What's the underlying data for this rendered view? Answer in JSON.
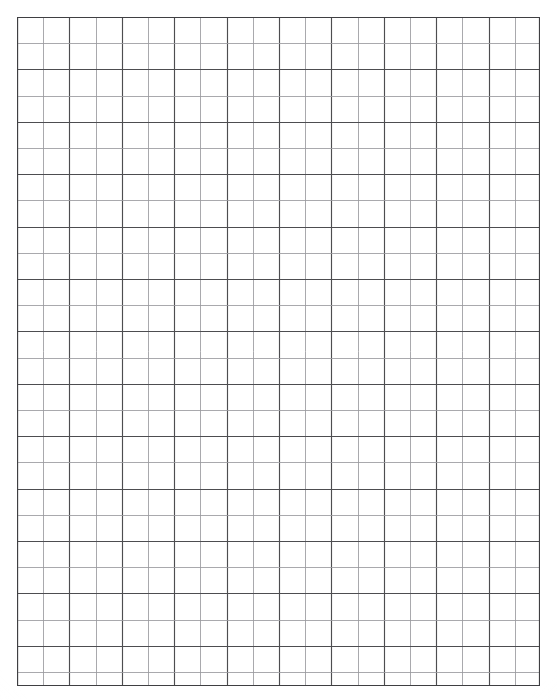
{
  "document": {
    "kind": "graph-paper",
    "title": "Graph Paper Grid",
    "background_color": "#ffffff"
  },
  "grid": {
    "origin_x": 17,
    "origin_y": 17,
    "width": 523,
    "height": 669,
    "cell_size": 26.2,
    "columns": 20,
    "rows": 25.5,
    "line_color_major": "#4d4d50",
    "line_color_minor": "#9a9a9e",
    "border_color": "#3f3f42",
    "major_line_width": 1.15,
    "minor_line_width": 0.85,
    "alternating": true,
    "alternation_note": "every other rule is drawn darker in both axes",
    "cell_fill": "#ffffff"
  },
  "margins": {
    "left": 17,
    "top": 17,
    "right": 17,
    "bottom": 14
  }
}
